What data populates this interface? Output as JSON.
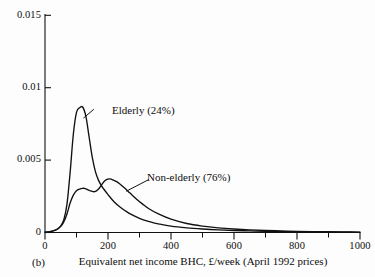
{
  "figure": {
    "panel_label": "(b)",
    "caption": "Equivalent net income BHC, £/week (April 1992 prices)",
    "background_color": "#fdfdfd",
    "ink_color": "#0d0d0d"
  },
  "chart_data": {
    "type": "line",
    "title": "",
    "subtitle": "",
    "xlabel": "Equivalent net income BHC, £/week (April 1992 prices)",
    "ylabel": "",
    "xlim": [
      0,
      1000
    ],
    "ylim": [
      0,
      0.015
    ],
    "xticks": [
      0,
      200,
      400,
      600,
      800,
      1000
    ],
    "xtick_labels": [
      "0",
      "200",
      "400",
      "600",
      "800",
      "1000"
    ],
    "xminor_tick_step": 100,
    "yticks": [
      0,
      0.005,
      0.01,
      0.015
    ],
    "ytick_labels": [
      "0",
      "0.005",
      "0.01",
      "0.015"
    ],
    "grid": false,
    "legend": "inline-annotations",
    "annotations": [
      {
        "text": "Elderly (24%)",
        "series": "Elderly (24%)",
        "label_x": 155,
        "label_y": 0.00865,
        "leader_to_x": 122,
        "leader_to_y": 0.0079
      },
      {
        "text": "Non-elderly (76%)",
        "series": "Non-elderly (76%)",
        "label_x": 330,
        "label_y": 0.0038,
        "leader_to_x": 258,
        "leader_to_y": 0.00285
      }
    ],
    "series": [
      {
        "name": "Elderly (24%)",
        "share_percent": 24,
        "peak_x": 120,
        "peak_y": 0.00865,
        "x": [
          0,
          10,
          20,
          30,
          40,
          50,
          60,
          70,
          80,
          90,
          100,
          110,
          120,
          130,
          140,
          150,
          160,
          170,
          180,
          190,
          200,
          220,
          240,
          260,
          280,
          300,
          320,
          340,
          360,
          400,
          450,
          500,
          550,
          600,
          650,
          700,
          750,
          800,
          850,
          900,
          950,
          1000
        ],
        "values": [
          2e-05,
          4e-05,
          8e-05,
          0.00014,
          0.00024,
          0.00045,
          0.0009,
          0.002,
          0.0042,
          0.0068,
          0.0083,
          0.00862,
          0.00865,
          0.008,
          0.0066,
          0.0052,
          0.0042,
          0.0036,
          0.0032,
          0.0029,
          0.00262,
          0.0021,
          0.00172,
          0.00142,
          0.00118,
          0.00098,
          0.00082,
          0.0007,
          0.0006,
          0.00044,
          0.00032,
          0.00024,
          0.00018,
          0.00014,
          0.00011,
          8e-05,
          6e-05,
          5e-05,
          4e-05,
          3e-05,
          2e-05,
          1e-05
        ]
      },
      {
        "name": "Non-elderly (76%)",
        "share_percent": 76,
        "peak_x": 205,
        "peak_y": 0.0037,
        "local_bump_x": 125,
        "local_bump_y": 0.00305,
        "local_dip_x": 158,
        "local_dip_y": 0.00282,
        "x": [
          0,
          10,
          20,
          30,
          40,
          50,
          60,
          70,
          80,
          90,
          100,
          110,
          120,
          125,
          135,
          145,
          158,
          170,
          180,
          190,
          200,
          205,
          215,
          230,
          250,
          270,
          290,
          310,
          330,
          360,
          400,
          450,
          500,
          550,
          600,
          650,
          700,
          750,
          800,
          850,
          900,
          950,
          1000
        ],
        "values": [
          2e-05,
          4e-05,
          8e-05,
          0.00014,
          0.00024,
          0.00042,
          0.00075,
          0.0013,
          0.00205,
          0.00258,
          0.00288,
          0.003,
          0.00305,
          0.00305,
          0.00296,
          0.00287,
          0.00282,
          0.003,
          0.0033,
          0.00358,
          0.00369,
          0.0037,
          0.00364,
          0.00348,
          0.00312,
          0.00272,
          0.00232,
          0.00196,
          0.00164,
          0.00128,
          0.00092,
          0.00062,
          0.00044,
          0.00032,
          0.00024,
          0.00018,
          0.00014,
          0.00011,
          8e-05,
          6e-05,
          5e-05,
          4e-05,
          3e-05
        ]
      }
    ]
  },
  "axes": {
    "y_tick_labels": [
      "0.015",
      "0.01",
      "0.005",
      "0"
    ],
    "x_tick_labels": [
      "0",
      "200",
      "400",
      "600",
      "800",
      "1000"
    ]
  }
}
